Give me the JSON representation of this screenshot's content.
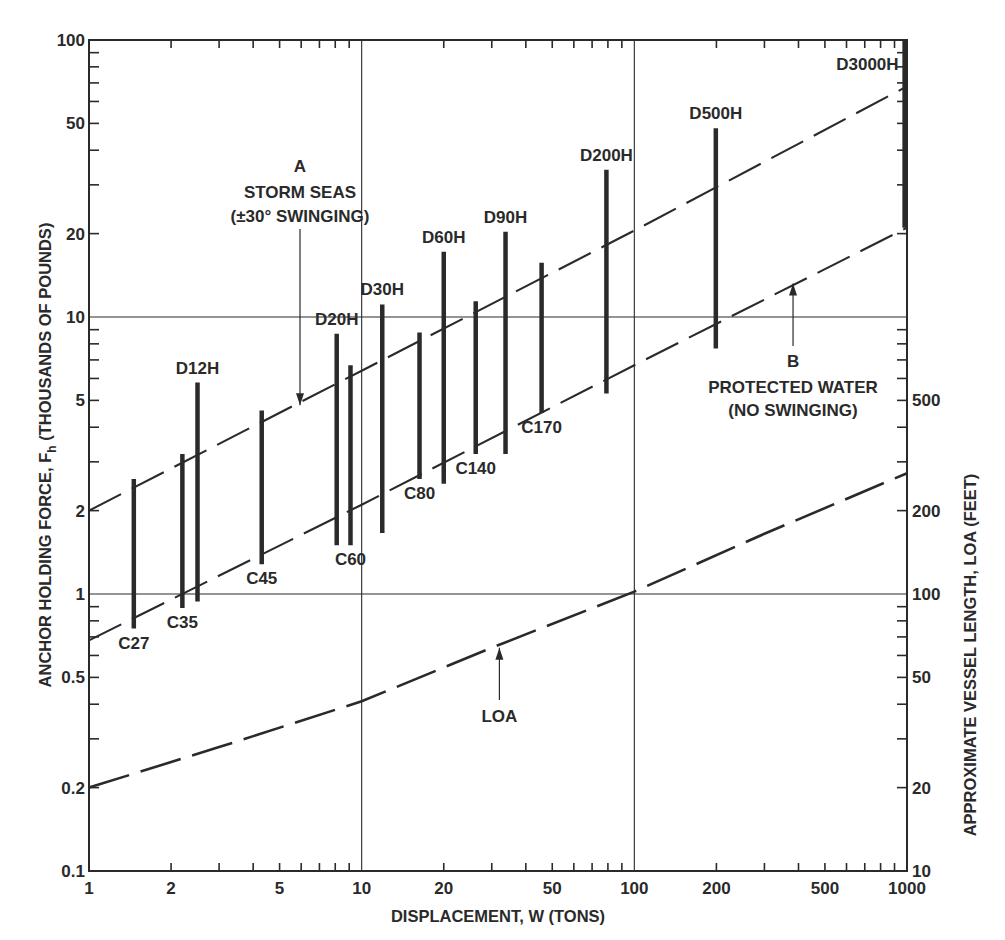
{
  "chart_data": {
    "type": "line",
    "title": "",
    "xlabel": "DISPLACEMENT, W (TONS)",
    "ylabel": "ANCHOR HOLDING FORCE, F_h (THOUSANDS OF POUNDS)",
    "ylabel_main": "ANCHOR HOLDING FORCE, F",
    "ylabel_sub": "h",
    "ylabel_tail": " (THOUSANDS OF POUNDS)",
    "y2label": "APPROXIMATE VESSEL LENGTH, LOA (FEET)",
    "xscale": "log",
    "yscale": "log",
    "y2scale": "log",
    "xlim": [
      1,
      1000
    ],
    "ylim": [
      0.1,
      100
    ],
    "y2lim": [
      10,
      10000
    ],
    "grid": "major decade lines only",
    "x_ticks": [
      1,
      2,
      5,
      10,
      20,
      50,
      100,
      200,
      500,
      1000
    ],
    "x_tick_labels": [
      "1",
      "2",
      "5",
      "10",
      "20",
      "50",
      "100",
      "200",
      "500",
      "1000"
    ],
    "y_ticks": [
      0.1,
      0.2,
      0.5,
      1,
      2,
      5,
      10,
      20,
      50,
      100
    ],
    "y_tick_labels": [
      "0.1",
      "0.2",
      "0.5",
      "1",
      "2",
      "5",
      "10",
      "20",
      "50",
      "100"
    ],
    "y2_ticks": [
      10,
      20,
      50,
      100,
      200,
      500
    ],
    "y2_tick_labels": [
      "10",
      "20",
      "50",
      "100",
      "200",
      "500"
    ],
    "series": [
      {
        "name": "A - STORM SEAS (±30° SWINGING)",
        "style": "dashed",
        "axis": "left",
        "x": [
          1,
          10,
          100,
          1000
        ],
        "values": [
          2.0,
          6.4,
          20.5,
          68
        ]
      },
      {
        "name": "B - PROTECTED WATER (NO SWINGING)",
        "style": "dashed",
        "axis": "left",
        "x": [
          1,
          10,
          100,
          1000
        ],
        "values": [
          0.68,
          2.1,
          6.7,
          21
        ]
      },
      {
        "name": "LOA",
        "style": "long-dashed",
        "axis": "right",
        "units": "feet",
        "x": [
          1,
          3,
          10,
          30,
          100,
          300,
          1000
        ],
        "values": [
          20,
          28,
          41,
          64,
          102,
          165,
          273
        ]
      }
    ],
    "anchor_ranges": [
      {
        "label": "C27",
        "w": 1.46,
        "f_min": 0.75,
        "f_max": 2.6,
        "label_pos": "bottom"
      },
      {
        "label": "C35",
        "w": 2.2,
        "f_min": 0.89,
        "f_max": 3.2,
        "label_pos": "bottom"
      },
      {
        "label": "D12H",
        "w": 2.5,
        "f_min": 0.94,
        "f_max": 5.8,
        "label_pos": "top"
      },
      {
        "label": "C45",
        "w": 4.3,
        "f_min": 1.28,
        "f_max": 4.6,
        "label_pos": "bottom"
      },
      {
        "label": "D20H",
        "w": 8.1,
        "f_min": 1.5,
        "f_max": 8.7,
        "label_pos": "top"
      },
      {
        "label": "C60",
        "w": 9.1,
        "f_min": 1.5,
        "f_max": 6.7,
        "label_pos": "bottom"
      },
      {
        "label": "D30H",
        "w": 11.9,
        "f_min": 1.66,
        "f_max": 11.1,
        "label_pos": "top"
      },
      {
        "label": "C80",
        "w": 16.3,
        "f_min": 2.6,
        "f_max": 8.8,
        "label_pos": "bottom"
      },
      {
        "label": "D60H",
        "w": 20,
        "f_min": 2.5,
        "f_max": 17.2,
        "label_pos": "top"
      },
      {
        "label": "C140",
        "w": 26.2,
        "f_min": 3.2,
        "f_max": 11.4,
        "label_pos": "bottom"
      },
      {
        "label": "D90H",
        "w": 33.7,
        "f_min": 3.2,
        "f_max": 20.3,
        "label_pos": "top"
      },
      {
        "label": "C170",
        "w": 45.7,
        "f_min": 4.5,
        "f_max": 15.7,
        "label_pos": "bottom"
      },
      {
        "label": "D200H",
        "w": 79,
        "f_min": 5.3,
        "f_max": 34,
        "label_pos": "top"
      },
      {
        "label": "D500H",
        "w": 199,
        "f_min": 7.7,
        "f_max": 48,
        "label_pos": "top"
      },
      {
        "label": "D3000H",
        "w": 980,
        "f_min": 21,
        "f_max": 100,
        "label_pos": "top-left"
      }
    ],
    "annotations": [
      {
        "id": "A",
        "lines": [
          "A",
          "STORM SEAS",
          "(±30° SWINGING)"
        ],
        "arrow_to": {
          "w": 5.6,
          "f": 4.8
        }
      },
      {
        "id": "B",
        "lines": [
          "B",
          "PROTECTED WATER",
          "(NO SWINGING)"
        ],
        "arrow_to": {
          "w": 382,
          "f": 13.2
        }
      },
      {
        "id": "LOA",
        "lines": [
          "LOA"
        ],
        "arrow_to": {
          "w": 32,
          "f": 0.64
        }
      }
    ]
  }
}
